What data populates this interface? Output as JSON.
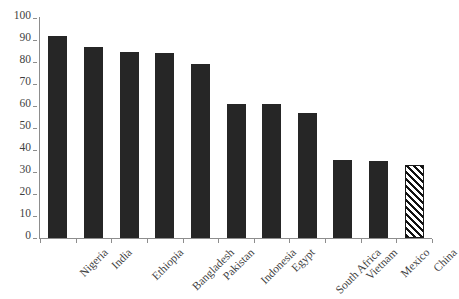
{
  "chart_data": {
    "type": "bar",
    "title": "",
    "subtitle": "",
    "xlabel": "",
    "ylabel": "",
    "categories": [
      "Nigeria",
      "India",
      "Ethiopia",
      "Bangladesh",
      "Pakistan",
      "Indonesia",
      "Egypt",
      "South Africa",
      "Vietnam",
      "Mexico",
      "China"
    ],
    "values": [
      92,
      87,
      84.5,
      84,
      79,
      61,
      61,
      57,
      35.5,
      35,
      33
    ],
    "series": [
      {
        "name": "",
        "values": [
          92,
          87,
          84.5,
          84,
          79,
          61,
          61,
          57,
          35.5,
          35,
          33
        ]
      }
    ],
    "ylim": [
      0,
      100
    ],
    "yticks": [
      0,
      10,
      20,
      30,
      40,
      50,
      60,
      70,
      80,
      90,
      100
    ],
    "ytick_labels": [
      "0",
      "10",
      "20",
      "30",
      "40",
      "50",
      "60",
      "70",
      "80",
      "90",
      "100"
    ],
    "grid": false,
    "legend": "none",
    "bar_styles": [
      "solid",
      "solid",
      "solid",
      "solid",
      "solid",
      "solid",
      "solid",
      "solid",
      "solid",
      "solid",
      "hatched"
    ],
    "colors": {
      "bar_fill": "#262626",
      "hatch_line": "#111111",
      "hatch_background": "#ffffff",
      "axis": "#8d8d8d",
      "text": "#3f3f3f",
      "background": "#ffffff"
    },
    "annotations": []
  }
}
